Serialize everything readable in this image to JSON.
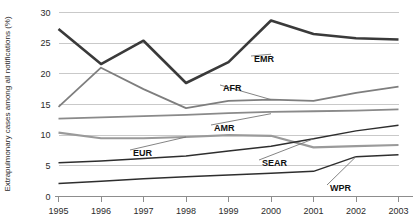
{
  "chart_data": {
    "type": "line",
    "title": "",
    "subtitle": "",
    "xlabel": "",
    "ylabel": "Extrapulmonary cases among all notifications (%)",
    "categories": [
      "1995",
      "1996",
      "1997",
      "1998",
      "1999",
      "2000",
      "2001",
      "2002",
      "2003"
    ],
    "x": [
      1995,
      1996,
      1997,
      1998,
      1999,
      2000,
      2001,
      2002,
      2003
    ],
    "xlim": [
      1995,
      2003
    ],
    "ylim": [
      0,
      30
    ],
    "yticks": [
      0,
      5,
      10,
      15,
      20,
      25,
      30
    ],
    "ytick_labels": [
      "0",
      "5",
      "10",
      "15",
      "20",
      "25",
      "30"
    ],
    "grid": true,
    "grid_axis": "y",
    "legend": "inline-labels",
    "legend_position": "inline",
    "series": [
      {
        "name": "EMR",
        "label": "EMR",
        "color": "#3a3a3a",
        "width": 2.6,
        "values": [
          27.3,
          21.6,
          25.4,
          18.5,
          21.9,
          28.7,
          26.5,
          25.8,
          25.6
        ]
      },
      {
        "name": "AFR",
        "label": "AFR",
        "color": "#7e7e7e",
        "width": 1.8,
        "values": [
          14.6,
          21.0,
          17.5,
          14.4,
          15.6,
          15.8,
          15.6,
          16.9,
          17.9
        ]
      },
      {
        "name": "AMR",
        "label": "AMR",
        "color": "#8a8a8a",
        "width": 1.8,
        "values": [
          12.7,
          12.9,
          13.1,
          13.3,
          13.6,
          13.8,
          13.9,
          14.0,
          14.2
        ]
      },
      {
        "name": "EUR",
        "label": "EUR",
        "color": "#9a9a9a",
        "width": 2.2,
        "values": [
          10.4,
          9.5,
          9.5,
          9.7,
          10.0,
          9.9,
          8.0,
          8.2,
          8.4
        ]
      },
      {
        "name": "SEAR",
        "label": "SEAR",
        "color": "#2e2e2e",
        "width": 1.5,
        "values": [
          5.5,
          5.8,
          6.2,
          6.6,
          7.4,
          8.2,
          9.4,
          10.7,
          11.6
        ]
      },
      {
        "name": "WPR",
        "label": "WPR",
        "color": "#2e2e2e",
        "width": 1.5,
        "values": [
          2.1,
          2.5,
          2.9,
          3.2,
          3.5,
          3.8,
          4.1,
          6.5,
          6.8
        ]
      }
    ],
    "annotations": [
      {
        "text": "EMR",
        "anchor_x": 2000,
        "anchor_y": 23.2,
        "label_x": 254,
        "label_y": 59
      },
      {
        "text": "AFR",
        "anchor_x": 2000,
        "anchor_y": 15.8,
        "label_x": 223,
        "label_y": 88
      },
      {
        "text": "AMR",
        "anchor_x": 2000,
        "anchor_y": 13.5,
        "label_x": 214,
        "label_y": 128
      },
      {
        "text": "EUR",
        "anchor_x": 1998,
        "anchor_y": 9.7,
        "label_x": 133,
        "label_y": 153
      },
      {
        "text": "SEAR",
        "anchor_x": 2001,
        "anchor_y": 9.4,
        "label_x": 262,
        "label_y": 163
      },
      {
        "text": "WPR",
        "anchor_x": 2002,
        "anchor_y": 6.5,
        "label_x": 330,
        "label_y": 188
      }
    ]
  }
}
